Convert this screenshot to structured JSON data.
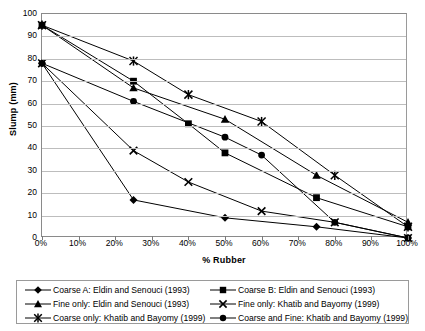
{
  "chart_data": {
    "type": "line",
    "title": "",
    "xlabel": "% Rubber",
    "ylabel": "Slump (mm)",
    "xlim": [
      0,
      100
    ],
    "ylim": [
      0,
      100
    ],
    "grid": "horizontal",
    "legend_position": "bottom",
    "x_tick_labels": [
      "0%",
      "10%",
      "20%",
      "30%",
      "40%",
      "50%",
      "60%",
      "70%",
      "80%",
      "90%",
      "100%"
    ],
    "x_tick_values": [
      0,
      10,
      20,
      30,
      40,
      50,
      60,
      70,
      80,
      90,
      100
    ],
    "y_tick_labels": [
      "0",
      "10",
      "20",
      "30",
      "40",
      "50",
      "60",
      "70",
      "80",
      "90",
      "100"
    ],
    "y_tick_values": [
      0,
      10,
      20,
      30,
      40,
      50,
      60,
      70,
      80,
      90,
      100
    ],
    "series": [
      {
        "name": "Coarse A: Eldin and Senouci (1993)",
        "marker": "diamond",
        "color": "#000000",
        "points": [
          [
            0,
            78
          ],
          [
            25,
            17
          ],
          [
            50,
            9
          ],
          [
            75,
            5
          ],
          [
            100,
            0
          ]
        ]
      },
      {
        "name": "Coarse B: Eldin and Senouci (1993)",
        "marker": "square",
        "color": "#000000",
        "points": [
          [
            0,
            95
          ],
          [
            25,
            70
          ],
          [
            40,
            51
          ],
          [
            50,
            38
          ],
          [
            75,
            18
          ],
          [
            100,
            5
          ]
        ]
      },
      {
        "name": "Fine only: Eldin and Senouci (1993)",
        "marker": "triangle",
        "color": "#000000",
        "points": [
          [
            0,
            95
          ],
          [
            25,
            67
          ],
          [
            50,
            53
          ],
          [
            75,
            28
          ],
          [
            100,
            7
          ]
        ]
      },
      {
        "name": "Fine only: Khatib and Bayomy (1999)",
        "marker": "x-cross",
        "color": "#000000",
        "points": [
          [
            0,
            78
          ],
          [
            25,
            39
          ],
          [
            40,
            25
          ],
          [
            60,
            12
          ],
          [
            80,
            7
          ],
          [
            100,
            0
          ]
        ]
      },
      {
        "name": "Coarse only: Khatib and Bayomy (1999)",
        "marker": "star",
        "color": "#000000",
        "points": [
          [
            0,
            95
          ],
          [
            25,
            79
          ],
          [
            40,
            64
          ],
          [
            60,
            52
          ],
          [
            80,
            28
          ],
          [
            100,
            5
          ]
        ]
      },
      {
        "name": "Coarse and Fine: Khatib and Bayomy (1999)",
        "marker": "circle",
        "color": "#000000",
        "points": [
          [
            0,
            78
          ],
          [
            25,
            61
          ],
          [
            50,
            45
          ],
          [
            60,
            37
          ],
          [
            80,
            7
          ],
          [
            100,
            0
          ]
        ]
      }
    ]
  },
  "legend": {
    "items": [
      {
        "label": "Coarse A: Eldin and Senouci (1993)",
        "marker": "diamond"
      },
      {
        "label": "Coarse B: Eldin and Senouci (1993)",
        "marker": "square"
      },
      {
        "label": "Fine only: Eldin and Senouci (1993)",
        "marker": "triangle"
      },
      {
        "label": "Fine only: Khatib and Bayomy (1999)",
        "marker": "x-cross"
      },
      {
        "label": "Coarse only: Khatib and Bayomy (1999)",
        "marker": "star"
      },
      {
        "label": "Coarse and Fine: Khatib and Bayomy (1999)",
        "marker": "circle"
      }
    ]
  }
}
